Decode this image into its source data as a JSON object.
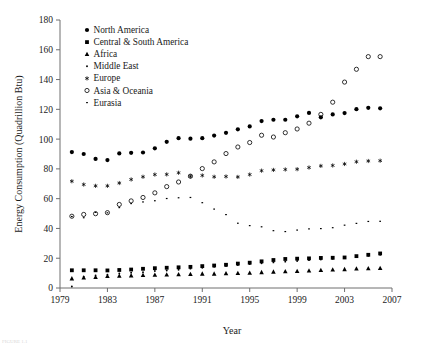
{
  "chart_data": {
    "type": "scatter",
    "title": "",
    "xlabel": "Year",
    "ylabel": "Energy Consumption (Quadrillion Btu)",
    "xlim": [
      1979,
      2007
    ],
    "ylim": [
      0,
      180
    ],
    "xticks": [
      1979,
      1983,
      1987,
      1991,
      1995,
      1999,
      2003,
      2007
    ],
    "yticks": [
      0,
      20,
      40,
      60,
      80,
      100,
      120,
      140,
      160,
      180
    ],
    "grid": false,
    "legend_position": "upper-left-inside",
    "x": [
      1980,
      1981,
      1982,
      1983,
      1984,
      1985,
      1986,
      1987,
      1988,
      1989,
      1990,
      1991,
      1992,
      1993,
      1994,
      1995,
      1996,
      1997,
      1998,
      1999,
      2000,
      2001,
      2002,
      2003,
      2004,
      2005,
      2006
    ],
    "series": [
      {
        "name": "North America",
        "marker": "filled-circle",
        "values": [
          91.3,
          90.0,
          86.7,
          85.9,
          90.4,
          90.8,
          91.0,
          93.8,
          98.2,
          100.6,
          100.3,
          100.6,
          102.4,
          104.2,
          106.6,
          108.5,
          112.1,
          113.0,
          113.0,
          115.3,
          117.6,
          114.6,
          116.6,
          117.5,
          120.1,
          121.0,
          120.7
        ]
      },
      {
        "name": "Central & South America",
        "marker": "filled-square",
        "values": [
          11.9,
          11.9,
          11.9,
          11.8,
          12.1,
          12.4,
          12.9,
          13.3,
          13.6,
          13.9,
          14.2,
          14.7,
          15.1,
          15.6,
          16.4,
          17.0,
          17.9,
          18.8,
          19.5,
          19.7,
          19.9,
          20.2,
          20.3,
          20.5,
          21.4,
          22.3,
          23.2
        ]
      },
      {
        "name": "Africa",
        "marker": "filled-triangle",
        "values": [
          6.4,
          7.0,
          7.3,
          8.0,
          8.2,
          8.4,
          8.7,
          8.8,
          9.0,
          9.1,
          9.3,
          9.6,
          9.6,
          9.8,
          10.0,
          10.2,
          10.6,
          10.9,
          11.2,
          11.4,
          11.7,
          12.0,
          12.3,
          12.6,
          13.0,
          13.2,
          13.4
        ]
      },
      {
        "name": "Middle East",
        "marker": "small-dot",
        "values": [
          1.0,
          7.6,
          8.5,
          9.0,
          9.8,
          10.3,
          10.6,
          11.4,
          11.8,
          12.3,
          13.0,
          13.6,
          14.2,
          14.7,
          15.4,
          16.1,
          16.6,
          17.2,
          17.7,
          18.1,
          18.7,
          19.1,
          19.6,
          20.3,
          21.0,
          21.6,
          22.3
        ]
      },
      {
        "name": "Europe",
        "marker": "asterisk",
        "values": [
          71.7,
          69.5,
          68.6,
          68.6,
          70.5,
          72.9,
          74.7,
          76.2,
          76.3,
          77.4,
          75.0,
          75.6,
          74.7,
          74.9,
          74.6,
          76.2,
          78.8,
          79.3,
          79.6,
          79.8,
          80.9,
          82.0,
          82.3,
          83.3,
          84.8,
          85.3,
          85.5
        ]
      },
      {
        "name": "Asia & Oceania",
        "marker": "open-circle",
        "values": [
          48.2,
          49.4,
          49.9,
          50.6,
          56.1,
          58.5,
          60.8,
          63.9,
          68.1,
          71.2,
          75.1,
          80.2,
          84.7,
          90.3,
          94.7,
          97.7,
          102.6,
          101.4,
          104.3,
          106.8,
          110.7,
          116.6,
          124.8,
          138.3,
          146.9,
          155.4,
          155.4
        ]
      },
      {
        "name": "Eurasia",
        "marker": "tiny-dot",
        "values": [
          48.0,
          47.2,
          50.8,
          50.5,
          54.0,
          56.7,
          57.8,
          58.6,
          60.1,
          60.6,
          60.8,
          57.3,
          53.0,
          49.3,
          43.5,
          41.9,
          41.1,
          38.5,
          37.9,
          38.9,
          39.7,
          39.9,
          40.5,
          42.2,
          43.4,
          44.7,
          44.8
        ]
      }
    ]
  },
  "legend": {
    "items": [
      {
        "label": "North America",
        "marker": "filled-circle"
      },
      {
        "label": "Central & South America",
        "marker": "filled-square"
      },
      {
        "label": "Africa",
        "marker": "filled-triangle"
      },
      {
        "label": "Middle East",
        "marker": "small-dot"
      },
      {
        "label": "Europe",
        "marker": "asterisk"
      },
      {
        "label": "Asia & Oceania",
        "marker": "open-circle"
      },
      {
        "label": "Eurasia",
        "marker": "tiny-dot"
      }
    ]
  },
  "colors": {
    "marker": "#000000",
    "axis": "#6f6f6f",
    "text": "#1a1a1a",
    "background": "#ffffff"
  },
  "caption": {
    "text": "FIGURE 1.1"
  }
}
